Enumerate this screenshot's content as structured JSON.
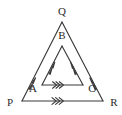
{
  "figure": {
    "background_color": "#ffffff",
    "line_color": "#3a3a3a",
    "label_color": "#2a2a2a",
    "labels": {
      "Q": "Q",
      "B": "B",
      "A": "A",
      "C": "C",
      "P": "P",
      "R": "R"
    },
    "outer_triangle": {
      "name": "PQR",
      "vertices": {
        "P": {
          "x": 22,
          "y": 101
        },
        "Q": {
          "x": 62,
          "y": 22
        },
        "R": {
          "x": 103,
          "y": 101
        }
      },
      "sides": [
        {
          "from": "P",
          "to": "Q",
          "marks": 2,
          "direction": "toward-Q"
        },
        {
          "from": "R",
          "to": "Q",
          "marks": 2,
          "direction": "toward-Q"
        },
        {
          "from": "P",
          "to": "R",
          "marks": 3,
          "direction": "toward-R"
        }
      ]
    },
    "inner_triangle": {
      "name": "ABC",
      "vertices": {
        "A": {
          "x": 42,
          "y": 85
        },
        "B": {
          "x": 62,
          "y": 46
        },
        "C": {
          "x": 83,
          "y": 85
        }
      },
      "sides": [
        {
          "from": "A",
          "to": "B",
          "marks": 2,
          "direction": "toward-B"
        },
        {
          "from": "C",
          "to": "B",
          "marks": 2,
          "direction": "toward-B"
        },
        {
          "from": "A",
          "to": "C",
          "marks": 3,
          "direction": "toward-C"
        }
      ]
    },
    "label_positions": {
      "Q": {
        "x": 62,
        "y": 15
      },
      "B": {
        "x": 62,
        "y": 39
      },
      "A": {
        "x": 33,
        "y": 92
      },
      "C": {
        "x": 92,
        "y": 92
      },
      "P": {
        "x": 10,
        "y": 106
      },
      "R": {
        "x": 114,
        "y": 106
      }
    }
  }
}
